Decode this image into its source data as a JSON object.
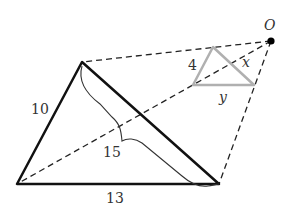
{
  "diagram": {
    "center_label": "O",
    "large_triangle": {
      "side_left": "10",
      "side_bottom": "13",
      "side_diagonal": "15",
      "color": "#111111"
    },
    "small_triangle": {
      "side_left": "4",
      "side_bottom": "y",
      "side_diagonal": "x",
      "color": "#b0b0b0"
    },
    "projection_lines": "dashed"
  }
}
